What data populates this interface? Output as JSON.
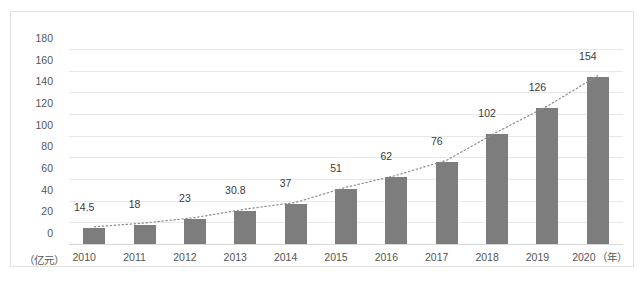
{
  "chart_data": {
    "type": "bar",
    "title": "",
    "xlabel": "（年）",
    "ylabel": "（亿元）",
    "categories": [
      "2010",
      "2011",
      "2012",
      "2013",
      "2014",
      "2015",
      "2016",
      "2017",
      "2018",
      "2019",
      "2020"
    ],
    "values": [
      14.5,
      18,
      23,
      30.8,
      37,
      51,
      62,
      76,
      102,
      126,
      154
    ],
    "value_labels": [
      "14.5",
      "18",
      "23",
      "30.8",
      "37",
      "51",
      "62",
      "76",
      "102",
      "126",
      "154"
    ],
    "ylim": [
      0,
      180
    ],
    "yticks": [
      "0",
      "20",
      "40",
      "60",
      "80",
      "100",
      "120",
      "140",
      "160",
      "180"
    ],
    "ytick_values": [
      0,
      20,
      40,
      60,
      80,
      100,
      120,
      140,
      160,
      180
    ],
    "grid": true,
    "legend": "none",
    "series": [
      {
        "name": "bars",
        "type": "bar",
        "color": "#7d7d7d",
        "values": [
          14.5,
          18,
          23,
          30.8,
          37,
          51,
          62,
          76,
          102,
          126,
          154
        ]
      },
      {
        "name": "trend",
        "type": "line",
        "style": "dotted",
        "color": "#8c8c8c",
        "values": [
          14.5,
          18,
          23,
          30.8,
          37,
          51,
          62,
          76,
          102,
          126,
          154
        ]
      }
    ],
    "colors": {
      "bar": "#7d7d7d",
      "trendline": "#8c8c8c",
      "gridline": "#e8e8e8",
      "axis_text": "#555555",
      "label_text": "#3a3a3a",
      "border": "#e2e2e2",
      "background": "#ffffff"
    }
  }
}
